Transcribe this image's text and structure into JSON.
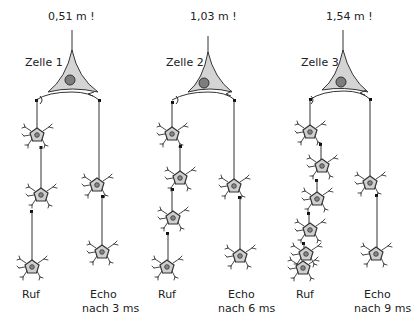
{
  "figure": {
    "panels": [
      {
        "distance_label": "0,51 m !",
        "cell_label": "Zelle 1",
        "call_label": "Ruf",
        "echo_label_line1": "Echo",
        "echo_label_line2": "nach 3 ms",
        "call_chain_neurons": 3,
        "echo_chain_neurons": 2
      },
      {
        "distance_label": "1,03 m !",
        "cell_label": "Zelle 2",
        "call_label": "Ruf",
        "echo_label_line1": "Echo",
        "echo_label_line2": "nach 6 ms",
        "call_chain_neurons": 4,
        "echo_chain_neurons": 2
      },
      {
        "distance_label": "1,54 m !",
        "cell_label": "Zelle 3",
        "call_label": "Ruf",
        "echo_label_line1": "Echo",
        "echo_label_line2": "nach 9 ms",
        "call_chain_neurons": 6,
        "echo_chain_neurons": 2
      }
    ],
    "colors": {
      "soma_fill": "#d4d4d4",
      "nucleus_fill": "#7d7d7d",
      "line": "#333333"
    }
  }
}
